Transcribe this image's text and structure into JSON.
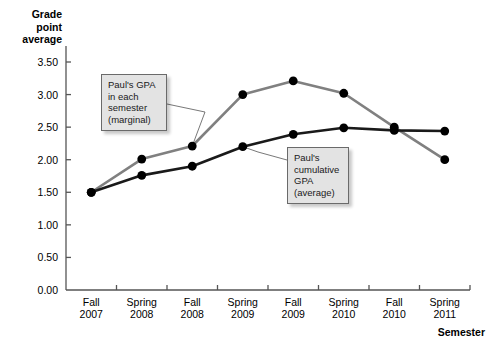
{
  "axes": {
    "y_title": "Grade\npoint\naverage",
    "x_title": "Semester",
    "y_ticks": [
      "0.00",
      "0.50",
      "1.00",
      "1.50",
      "2.00",
      "2.50",
      "3.00",
      "3.50"
    ],
    "x_ticks": [
      "Fall\n2007",
      "Spring\n2008",
      "Fall\n2008",
      "Spring\n2009",
      "Fall\n2009",
      "Spring\n2010",
      "Fall\n2010",
      "Spring\n2011"
    ]
  },
  "callouts": {
    "marginal": "Paul's GPA\nin each\nsemester\n(marginal)",
    "cumulative": "Paul's\ncumulative\nGPA\n(average)"
  },
  "colors": {
    "marginal_line": "#808080",
    "cumulative_line": "#1a1a1a",
    "marker": "#000000",
    "axis": "#555555",
    "callout_fill": "#e3e3e3",
    "callout_border": "#6a6a6a",
    "background": "#ffffff"
  },
  "chart_data": {
    "type": "line",
    "title": "",
    "xlabel": "Semester",
    "ylabel": "Grade point average",
    "categories": [
      "Fall 2007",
      "Spring 2008",
      "Fall 2008",
      "Spring 2009",
      "Fall 2009",
      "Spring 2010",
      "Fall 2010",
      "Spring 2011"
    ],
    "series": [
      {
        "name": "Paul's GPA in each semester (marginal)",
        "color": "#808080",
        "values": [
          1.5,
          2.01,
          2.21,
          3.0,
          3.21,
          3.02,
          2.5,
          2.0
        ]
      },
      {
        "name": "Paul's cumulative GPA (average)",
        "color": "#1a1a1a",
        "values": [
          1.5,
          1.76,
          1.9,
          2.2,
          2.39,
          2.49,
          2.45,
          2.44
        ]
      }
    ],
    "ylim": [
      0.0,
      3.5
    ],
    "ytick_step": 0.5,
    "grid": false,
    "legend": "none",
    "annotations": [
      {
        "text": "Paul's GPA in each semester (marginal)",
        "points_to_series": "Paul's GPA in each semester (marginal)",
        "points_to_category": "Fall 2008"
      },
      {
        "text": "Paul's cumulative GPA (average)",
        "points_to_series": "Paul's cumulative GPA (average)",
        "points_to_category": "Spring 2009"
      }
    ]
  }
}
